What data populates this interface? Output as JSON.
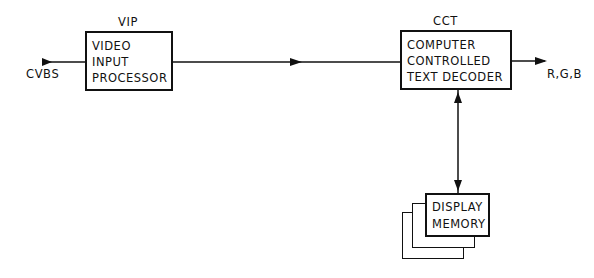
{
  "diagram": {
    "input_signal": "CVBS",
    "output_signal": "R,G,B",
    "blocks": [
      {
        "id": "vip",
        "tag": "VIP",
        "lines": [
          "VIDEO",
          "INPUT",
          "PROCESSOR"
        ]
      },
      {
        "id": "cct",
        "tag": "CCT",
        "lines": [
          "COMPUTER",
          "CONTROLLED",
          "TEXT DECODER"
        ]
      },
      {
        "id": "memory",
        "tag": "",
        "lines": [
          "DISPLAY",
          "MEMORY"
        ]
      }
    ],
    "connections": [
      {
        "from": "CVBS",
        "to": "vip",
        "direction": "forward"
      },
      {
        "from": "vip",
        "to": "cct",
        "direction": "forward"
      },
      {
        "from": "cct",
        "to": "R,G,B",
        "direction": "forward"
      },
      {
        "from": "cct",
        "to": "memory",
        "direction": "bidirectional"
      }
    ]
  }
}
